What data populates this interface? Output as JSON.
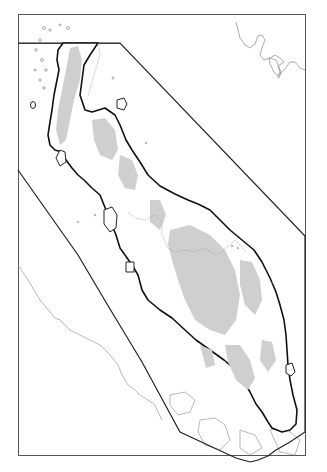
{
  "map": {
    "title": "",
    "description": "Outline map of a long peninsula with grey shaded highlands, thick coastline, thin neighbouring coastlines, and a polygonal boundary enclosing the peninsula",
    "colors": {
      "background": "#ffffff",
      "land": "#ffffff",
      "highland": "#cfcfcf",
      "coastline": "#111111",
      "thin_coast": "#888888",
      "boundary": "#222222",
      "frame": "#555555"
    },
    "frame": {
      "x": 18,
      "y": 21,
      "width": 287,
      "height": 438
    },
    "inner_divider_y": 43,
    "boundary_polygon": "18,43 93,43 305,235 305,435 283,446 263,460 253,462 ... 18,170",
    "labels": []
  }
}
